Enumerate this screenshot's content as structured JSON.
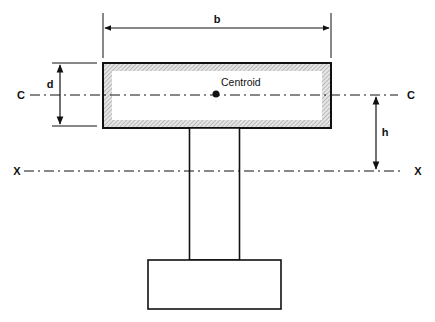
{
  "diagram": {
    "type": "structural cross-section (T-section beam / flange on web on base)",
    "labels": {
      "width": "b",
      "depth": "d",
      "height_offset": "h",
      "centroid": "Centroid",
      "centroid_axis_left": "C",
      "centroid_axis_right": "C",
      "reference_axis_left": "X",
      "reference_axis_right": "X"
    },
    "colors": {
      "stroke": "#111111",
      "hatch": "#9a9a9a",
      "background": "#ffffff"
    },
    "elements": [
      {
        "id": "flange",
        "description": "hatched rectangular flange, width b, depth d"
      },
      {
        "id": "web",
        "description": "vertical web rectangle below flange"
      },
      {
        "id": "base",
        "description": "wider base rectangle at bottom"
      },
      {
        "id": "centroid-axis",
        "description": "dash-dot line C–C through centroid"
      },
      {
        "id": "reference-axis",
        "description": "dash-dot line X–X"
      },
      {
        "id": "dimension-b",
        "description": "horizontal double arrow above flange"
      },
      {
        "id": "dimension-d",
        "description": "vertical double arrow left of flange"
      },
      {
        "id": "dimension-h",
        "description": "vertical double arrow between C–C and X–X"
      }
    ]
  }
}
